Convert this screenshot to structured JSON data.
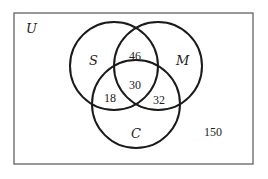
{
  "diagram": {
    "type": "venn",
    "universe": {
      "label": "U",
      "outside_value": "150"
    },
    "sets": [
      {
        "name": "S",
        "label": "S"
      },
      {
        "name": "M",
        "label": "M"
      },
      {
        "name": "C",
        "label": "C"
      }
    ],
    "regions": {
      "S_and_M_only": "46",
      "S_and_M_and_C": "30",
      "S_and_C_only": "18",
      "M_and_C_only": "32",
      "outside": "150"
    },
    "colors": {
      "stroke": "#1a1a1a",
      "box": "#555555",
      "background": "#ffffff"
    }
  }
}
